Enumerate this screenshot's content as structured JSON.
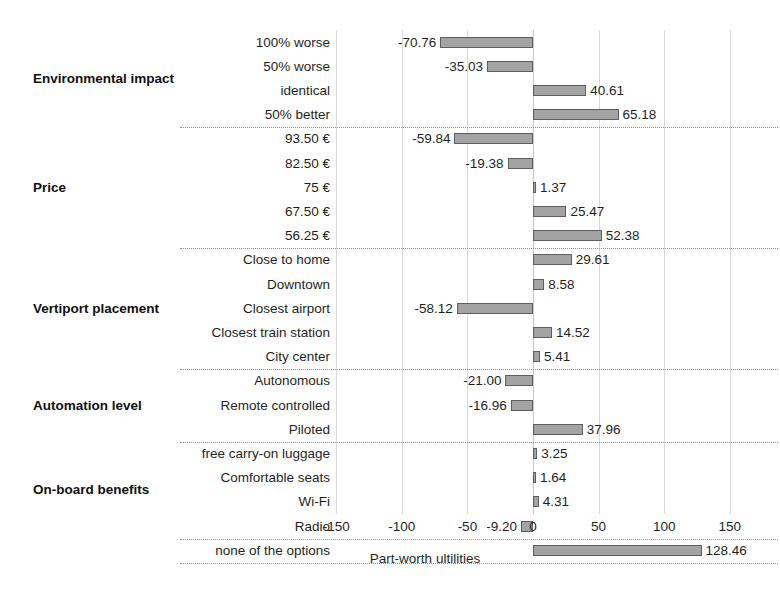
{
  "chart_data": {
    "type": "bar",
    "orientation": "horizontal",
    "title": "",
    "xlabel": "Part-worth ultilities",
    "ylabel": "",
    "xlim": [
      -175,
      175
    ],
    "xticks": [
      -150,
      -100,
      -50,
      0,
      50,
      100,
      150
    ],
    "grid": "vertical",
    "legend": "none",
    "bar_color": "#a3a3a3",
    "bar_border_color": "#5f5f5f",
    "gridline_color": "#d9d9d9",
    "divider_color": "#8f8f8f",
    "categories": [
      "100% worse",
      "50% worse",
      "identical",
      "50% better",
      "93.50 €",
      "82.50 €",
      "75 €",
      "67.50 €",
      "56.25 €",
      "Close to home",
      "Downtown",
      "Closest airport",
      "Closest train station",
      "City center",
      "Autonomous",
      "Remote controlled",
      "Piloted",
      "free carry-on luggage",
      "Comfortable seats",
      "Wi-Fi",
      "Radio",
      "none of the options"
    ],
    "values": [
      -70.76,
      -35.03,
      40.61,
      65.18,
      -59.84,
      -19.38,
      1.37,
      25.47,
      52.38,
      29.61,
      8.58,
      -58.12,
      14.52,
      5.41,
      -21.0,
      -16.96,
      37.96,
      3.25,
      1.64,
      4.31,
      -9.2,
      128.46
    ],
    "value_labels": [
      "-70.76",
      "-35.03",
      "40.61",
      "65.18",
      "-59.84",
      "-19.38",
      "1.37",
      "25.47",
      "52.38",
      "29.61",
      "8.58",
      "-58.12",
      "14.52",
      "5.41",
      "-21.00",
      "-16.96",
      "37.96",
      "3.25",
      "1.64",
      "4.31",
      "-9.20",
      "128.46"
    ],
    "groups": [
      {
        "label": "Environmental impact",
        "start": 0,
        "count": 4
      },
      {
        "label": "Price",
        "start": 4,
        "count": 5
      },
      {
        "label": "Vertiport placement",
        "start": 9,
        "count": 5
      },
      {
        "label": "Automation level",
        "start": 14,
        "count": 3
      },
      {
        "label": "On-board benefits",
        "start": 17,
        "count": 4
      },
      {
        "label": "",
        "start": 21,
        "count": 1
      }
    ]
  }
}
